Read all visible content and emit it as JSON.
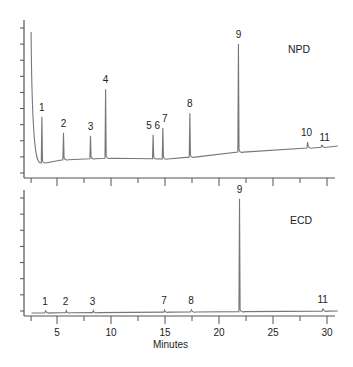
{
  "chart_data": [
    {
      "type": "line",
      "title": "NPD",
      "xlabel": "Minutes",
      "ylabel": "",
      "xlim": [
        2.5,
        31
      ],
      "xticks_major": [
        5,
        10,
        15,
        20,
        25,
        30
      ],
      "xticks_minor": [
        2.5,
        7.5,
        12.5,
        17.5,
        22.5,
        27.5
      ],
      "y_tick_count": 10,
      "grid": false,
      "peaks": [
        {
          "label": "1",
          "rt": 3.6,
          "height": 46
        },
        {
          "label": "2",
          "rt": 5.6,
          "height": 27
        },
        {
          "label": "3",
          "rt": 8.1,
          "height": 23
        },
        {
          "label": "4",
          "rt": 9.5,
          "height": 69
        },
        {
          "label": "5",
          "rt": 13.9,
          "height": 24
        },
        {
          "label": "6",
          "rt": 14.2,
          "height": 24
        },
        {
          "label": "7",
          "rt": 14.8,
          "height": 31
        },
        {
          "label": "8",
          "rt": 17.3,
          "height": 44
        },
        {
          "label": "9",
          "rt": 21.8,
          "height": 108
        },
        {
          "label": "10",
          "rt": 28.2,
          "height": 6
        },
        {
          "label": "11",
          "rt": 29.5,
          "height": 2
        }
      ],
      "baseline": [
        [
          2.5,
          5
        ],
        [
          3.5,
          14
        ],
        [
          5,
          17
        ],
        [
          10,
          19
        ],
        [
          15,
          18
        ],
        [
          20,
          22
        ],
        [
          22.5,
          26
        ],
        [
          30,
          30
        ],
        [
          31,
          31
        ]
      ],
      "solvent_front": {
        "rt": 2.6,
        "height": 145
      }
    },
    {
      "type": "line",
      "title": "ECD",
      "xlabel": "Minutes",
      "ylabel": "",
      "xlim": [
        2.5,
        31
      ],
      "xticks_major": [
        5,
        10,
        15,
        20,
        25,
        30
      ],
      "xticks_minor": [
        2.5,
        7.5,
        12.5,
        17.5,
        22.5,
        27.5
      ],
      "y_tick_count": 8,
      "grid": false,
      "peaks": [
        {
          "label": "1",
          "rt": 3.9,
          "height": 1
        },
        {
          "label": "2",
          "rt": 5.8,
          "height": 0
        },
        {
          "label": "3",
          "rt": 8.3,
          "height": 0
        },
        {
          "label": "7",
          "rt": 14.9,
          "height": 0
        },
        {
          "label": "8",
          "rt": 17.4,
          "height": 1
        },
        {
          "label": "9",
          "rt": 21.9,
          "height": 113
        },
        {
          "label": "11",
          "rt": 29.6,
          "height": 2
        }
      ],
      "baseline": [
        [
          2.5,
          0
        ],
        [
          31,
          2
        ]
      ]
    }
  ],
  "labels": {
    "npd": "NPD",
    "ecd": "ECD",
    "xaxis_title": "Minutes",
    "xtick_labels": [
      "5",
      "10",
      "15",
      "20",
      "25",
      "30"
    ]
  }
}
